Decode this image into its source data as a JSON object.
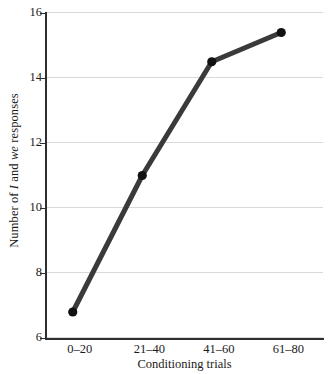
{
  "chart_data": {
    "type": "line",
    "title": "",
    "subtitle": "",
    "categories": [
      "0–20",
      "21–40",
      "41–60",
      "61–80"
    ],
    "values": [
      6.8,
      11.0,
      14.5,
      15.4
    ],
    "series": [
      {
        "name": "Number of I and we responses",
        "values": [
          6.8,
          11.0,
          14.5,
          15.4
        ]
      }
    ],
    "xlabel": "Conditioning trials",
    "ylabel": "Number of I and we responses",
    "ylabel_parts": [
      {
        "text": "Number of ",
        "italic": false
      },
      {
        "text": "I",
        "italic": true
      },
      {
        "text": " and ",
        "italic": false
      },
      {
        "text": "we",
        "italic": true
      },
      {
        "text": " responses",
        "italic": false
      }
    ],
    "ylim": [
      6,
      16
    ],
    "yticks": [
      16,
      14,
      12,
      10,
      8,
      6
    ],
    "ytick_labels": [
      "16",
      "14",
      "12",
      "10",
      "8",
      "6"
    ],
    "xtick_labels": [
      "0–20",
      "21–40",
      "41–60",
      "61–80"
    ],
    "grid": true,
    "grid_axis": "y",
    "legend": false,
    "legend_position": "none",
    "marker": "filled-circle",
    "colors": {
      "line": "#3a3a3a",
      "marker": "#111111",
      "grid": "#d9d9d9",
      "axis": "#2e2e2e",
      "text": "#1a1a1a",
      "background": "#ffffff"
    }
  }
}
